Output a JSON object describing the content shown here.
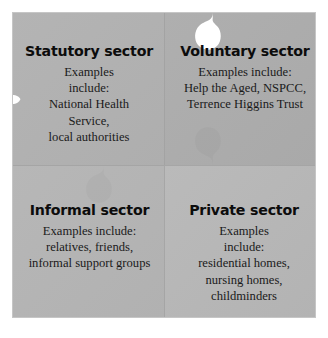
{
  "diagram": {
    "type": "jigsaw-2x2",
    "colors": {
      "background": "#ffffff",
      "piece_top_left": "#b0b0b0",
      "piece_top_right": "#acacac",
      "piece_bottom_left": "#b4b4b4",
      "piece_bottom_right": "#b7b7b7",
      "notch": "#ffffff",
      "seam": "#a2a2a2",
      "text": "#151515"
    },
    "pieces": [
      {
        "id": "statutory",
        "title": "Statutory sector",
        "lines": [
          "Examples",
          "include:",
          "National Health",
          "Service,",
          "local authorities"
        ],
        "notch_edge": "left"
      },
      {
        "id": "voluntary",
        "title": "Voluntary sector",
        "lines": [
          "Examples include:",
          "Help the Aged, NSPCC,",
          "Terrence Higgins Trust"
        ],
        "notch_edge": "top"
      },
      {
        "id": "informal",
        "title": "Informal sector",
        "lines": [
          "Examples include:",
          "relatives, friends,",
          "informal support groups"
        ],
        "notch_edge": "bottom"
      },
      {
        "id": "private",
        "title": "Private sector",
        "lines": [
          "Examples",
          "include:",
          "residential homes,",
          "nursing homes,",
          "childminders"
        ],
        "notch_edge": "right"
      }
    ]
  }
}
